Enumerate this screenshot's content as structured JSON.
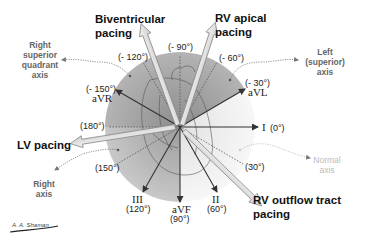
{
  "diagram": {
    "type": "hexaxial reference system with pacing vectors",
    "center": [
      180,
      127
    ],
    "radius": 75,
    "colors": {
      "upper_sector": "#9a9a9a",
      "left_lower_sector": "#b0b0b0",
      "right_lower_sector": "#efefef",
      "lead_arrow": "#333333",
      "pacing_arrow_fill": "#e8e8e8",
      "pacing_arrow_stroke": "#8a8a8a",
      "axis_label": "#666666",
      "normal_axis_label": "#bbbbbb"
    },
    "leads": [
      {
        "name": "I",
        "angle_label": "(0°)",
        "angle": 0
      },
      {
        "name": "II",
        "angle_label": "(60°)",
        "angle": 60
      },
      {
        "name": "aVF",
        "angle_label": "(90°)",
        "angle": 90
      },
      {
        "name": "III",
        "angle_label": "(120°)",
        "angle": 120
      },
      {
        "name": "aVR",
        "angle_label": "(- 150°)",
        "angle": -150
      },
      {
        "name": "aVL",
        "angle_label": "(- 30°)",
        "angle": -30
      }
    ],
    "reference_angles": [
      {
        "label": "(- 90°)",
        "angle": -90
      },
      {
        "label": "(- 120°)",
        "angle": -120
      },
      {
        "label": "(- 60°)",
        "angle": -60
      },
      {
        "label": "(180°)",
        "angle": 180
      },
      {
        "label": "(150°)",
        "angle": 150
      },
      {
        "label": "(30°)",
        "angle": 30
      }
    ],
    "pacing_sites": [
      {
        "label_line1": "Biventricular",
        "label_line2": "pacing",
        "angle": -110
      },
      {
        "label_line1": "RV apical",
        "label_line2": "pacing",
        "angle": -70
      },
      {
        "label_line1": "LV pacing",
        "label_line2": "",
        "angle": 170
      },
      {
        "label_line1": "RV outflow tract",
        "label_line2": "pacing",
        "angle": 45
      }
    ],
    "axis_regions": [
      {
        "lines": [
          "Right",
          "superior",
          "quadrant",
          "axis"
        ]
      },
      {
        "lines": [
          "Left",
          "(superior)",
          "axis"
        ]
      },
      {
        "lines": [
          "Right",
          "axis"
        ]
      },
      {
        "lines": [
          "Normal",
          "axis"
        ]
      }
    ],
    "signature": "A. A. Shaman"
  }
}
